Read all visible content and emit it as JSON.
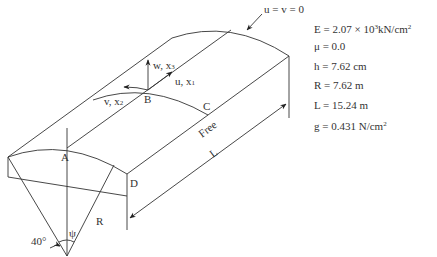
{
  "diagram": {
    "points": {
      "A": "A",
      "B": "B",
      "C": "C",
      "D": "D"
    },
    "axes": {
      "u": "u, x",
      "u_sub": "1",
      "v": "v, x",
      "v_sub": "2",
      "w": "w, x",
      "w_sub": "3"
    },
    "boundary_condition": "u = v = 0",
    "edge_label_free": "Free",
    "length_label": "L",
    "radius_label": "R",
    "angle_label": "40°",
    "psi_label": "ψ"
  },
  "parameters": [
    {
      "pre": "E = 2.07 × 10",
      "sup": "3",
      "post": "kN/cm",
      "sup2": "2"
    },
    {
      "pre": "μ = 0.0"
    },
    {
      "pre": "h = 7.62 cm"
    },
    {
      "pre": "R = 7.62 m"
    },
    {
      "pre": "L = 15.24 m"
    },
    {
      "pre": "g = 0.431 N/cm",
      "sup2": "2"
    }
  ]
}
